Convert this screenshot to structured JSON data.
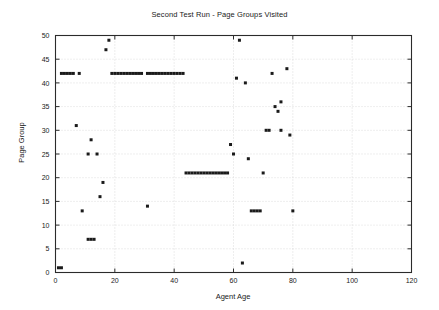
{
  "chart_data": {
    "type": "scatter",
    "title": "Second Test Run - Page Groups Visited",
    "xlabel": "Agent Age",
    "ylabel": "Page Group",
    "xlim": [
      0,
      120
    ],
    "ylim": [
      0,
      50
    ],
    "xticks": [
      0,
      20,
      40,
      60,
      80,
      100,
      120
    ],
    "yticks": [
      0,
      5,
      10,
      15,
      20,
      25,
      30,
      35,
      40,
      45,
      50
    ],
    "grid": true,
    "legend": "none",
    "marker": "square",
    "marker_color": "#1a1a1a",
    "series": [
      {
        "name": "Page Groups Visited",
        "points": [
          [
            1,
            1
          ],
          [
            2,
            1
          ],
          [
            2,
            42
          ],
          [
            3,
            42
          ],
          [
            4,
            42
          ],
          [
            5,
            42
          ],
          [
            6,
            42
          ],
          [
            7,
            31
          ],
          [
            8,
            42
          ],
          [
            9,
            13
          ],
          [
            11,
            25
          ],
          [
            11,
            7
          ],
          [
            12,
            7
          ],
          [
            13,
            7
          ],
          [
            12,
            28
          ],
          [
            14,
            25
          ],
          [
            15,
            16
          ],
          [
            16,
            19
          ],
          [
            17,
            47
          ],
          [
            18,
            49
          ],
          [
            19,
            42
          ],
          [
            20,
            42
          ],
          [
            21,
            42
          ],
          [
            22,
            42
          ],
          [
            23,
            42
          ],
          [
            24,
            42
          ],
          [
            25,
            42
          ],
          [
            26,
            42
          ],
          [
            27,
            42
          ],
          [
            28,
            42
          ],
          [
            29,
            42
          ],
          [
            31,
            14
          ],
          [
            31,
            42
          ],
          [
            32,
            42
          ],
          [
            33,
            42
          ],
          [
            34,
            42
          ],
          [
            35,
            42
          ],
          [
            36,
            42
          ],
          [
            37,
            42
          ],
          [
            38,
            42
          ],
          [
            39,
            42
          ],
          [
            40,
            42
          ],
          [
            41,
            42
          ],
          [
            42,
            42
          ],
          [
            43,
            42
          ],
          [
            44,
            21
          ],
          [
            45,
            21
          ],
          [
            46,
            21
          ],
          [
            47,
            21
          ],
          [
            48,
            21
          ],
          [
            49,
            21
          ],
          [
            50,
            21
          ],
          [
            51,
            21
          ],
          [
            52,
            21
          ],
          [
            53,
            21
          ],
          [
            54,
            21
          ],
          [
            55,
            21
          ],
          [
            56,
            21
          ],
          [
            57,
            21
          ],
          [
            58,
            21
          ],
          [
            59,
            27
          ],
          [
            60,
            25
          ],
          [
            61,
            41
          ],
          [
            62,
            49
          ],
          [
            63,
            2
          ],
          [
            64,
            40
          ],
          [
            65,
            24
          ],
          [
            66,
            13
          ],
          [
            67,
            13
          ],
          [
            68,
            13
          ],
          [
            69,
            13
          ],
          [
            70,
            21
          ],
          [
            71,
            30
          ],
          [
            72,
            30
          ],
          [
            73,
            42
          ],
          [
            74,
            35
          ],
          [
            75,
            34
          ],
          [
            76,
            30
          ],
          [
            76,
            36
          ],
          [
            78,
            43
          ],
          [
            79,
            29
          ],
          [
            80,
            13
          ]
        ]
      }
    ]
  },
  "axes": {
    "x_tick_labels": [
      "0",
      "20",
      "40",
      "60",
      "80",
      "100",
      "120"
    ],
    "y_tick_labels": [
      "0",
      "5",
      "10",
      "15",
      "20",
      "25",
      "30",
      "35",
      "40",
      "45",
      "50"
    ]
  }
}
